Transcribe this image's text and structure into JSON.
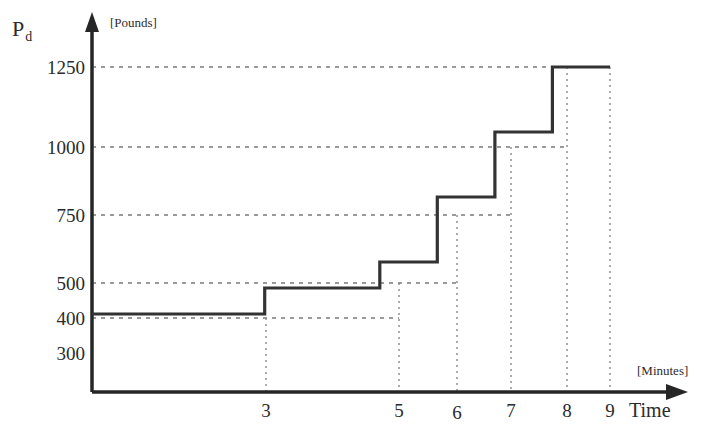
{
  "chart_data": {
    "type": "line",
    "subtype": "step",
    "title": "",
    "ylabel": "P_d",
    "y_unit": "[Pounds]",
    "xlabel": "Time",
    "x_unit": "[Minutes]",
    "grid": true,
    "legend": null,
    "xlim": [
      0,
      9.6
    ],
    "ylim": [
      0,
      1400
    ],
    "x_ticks": [
      3,
      5,
      6,
      7,
      8,
      9
    ],
    "x_tick_labels": [
      "3",
      "5",
      "6",
      "7",
      "8",
      "9"
    ],
    "y_ticks": [
      300,
      400,
      500,
      750,
      1000,
      1250
    ],
    "y_tick_labels": [
      "300",
      "400",
      "500",
      "750",
      "1000",
      "1250"
    ],
    "steps": [
      {
        "x_start": 0,
        "x_end": 3,
        "value": 300
      },
      {
        "x_start": 3,
        "x_end": 5,
        "value": 400
      },
      {
        "x_start": 5,
        "x_end": 6,
        "value": 500
      },
      {
        "x_start": 6,
        "x_end": 7,
        "value": 750
      },
      {
        "x_start": 7,
        "x_end": 8,
        "value": 1000
      },
      {
        "x_start": 8,
        "x_end": 9,
        "value": 1250
      }
    ],
    "x": [
      0,
      3,
      3,
      5,
      5,
      6,
      6,
      7,
      7,
      8,
      8,
      9
    ],
    "y": [
      300,
      300,
      400,
      400,
      500,
      500,
      750,
      750,
      1000,
      1000,
      1250,
      1250
    ],
    "line_color": "#333333",
    "grid_color": "#808080",
    "axis_color": "#262626"
  },
  "labels": {
    "y_axis_symbol": "P",
    "y_axis_subscript": "d",
    "y_axis_unit": "[Pounds]",
    "x_axis_unit": "[Minutes]",
    "x_axis_name": "Time",
    "y_ticks": {
      "t1250": "1250",
      "t1000": "1000",
      "t750": "750",
      "t500": "500",
      "t400": "400",
      "t300": "300"
    },
    "x_ticks": {
      "t3": "3",
      "t5": "5",
      "t6": "6",
      "t7": "7",
      "t8": "8",
      "t9": "9"
    }
  }
}
